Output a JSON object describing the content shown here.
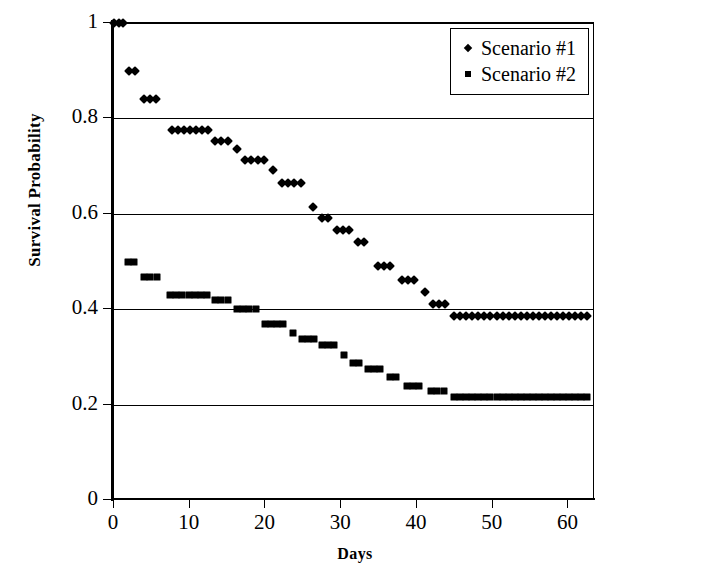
{
  "chart_data": {
    "type": "scatter",
    "title": "",
    "xlabel": "Days",
    "ylabel": "Survival Probability",
    "xlim": [
      0,
      63.5
    ],
    "ylim": [
      0,
      1
    ],
    "xticks": [
      0,
      10,
      20,
      30,
      40,
      50,
      60
    ],
    "yticks": [
      0,
      0.2,
      0.4,
      0.6,
      0.8,
      1
    ],
    "xtick_labels": [
      "0",
      "10",
      "20",
      "30",
      "40",
      "50",
      "60"
    ],
    "ytick_labels": [
      "0",
      "0.2",
      "0.4",
      "0.6",
      "0.8",
      "1"
    ],
    "grid": "horizontal",
    "legend_position": "top-right",
    "marker_color": "#000000",
    "series": [
      {
        "name": "Scenario #1",
        "marker": "diamond",
        "points": [
          [
            0.0,
            1.0
          ],
          [
            0.6,
            1.0
          ],
          [
            1.2,
            1.0
          ],
          [
            2.0,
            0.9
          ],
          [
            2.8,
            0.9
          ],
          [
            4.0,
            0.84
          ],
          [
            4.8,
            0.84
          ],
          [
            5.6,
            0.84
          ],
          [
            7.6,
            0.775
          ],
          [
            8.4,
            0.775
          ],
          [
            9.2,
            0.775
          ],
          [
            10.0,
            0.775
          ],
          [
            10.8,
            0.775
          ],
          [
            11.6,
            0.775
          ],
          [
            12.4,
            0.775
          ],
          [
            13.3,
            0.752
          ],
          [
            14.1,
            0.752
          ],
          [
            15.0,
            0.752
          ],
          [
            16.2,
            0.735
          ],
          [
            17.3,
            0.712
          ],
          [
            18.1,
            0.712
          ],
          [
            19.0,
            0.712
          ],
          [
            19.8,
            0.712
          ],
          [
            21.0,
            0.692
          ],
          [
            22.2,
            0.665
          ],
          [
            23.0,
            0.665
          ],
          [
            23.8,
            0.665
          ],
          [
            24.7,
            0.665
          ],
          [
            26.3,
            0.615
          ],
          [
            27.4,
            0.592
          ],
          [
            28.2,
            0.592
          ],
          [
            29.4,
            0.565
          ],
          [
            30.2,
            0.565
          ],
          [
            31.0,
            0.565
          ],
          [
            32.2,
            0.54
          ],
          [
            33.0,
            0.54
          ],
          [
            34.9,
            0.49
          ],
          [
            35.7,
            0.49
          ],
          [
            36.5,
            0.49
          ],
          [
            38.0,
            0.462
          ],
          [
            38.8,
            0.462
          ],
          [
            39.6,
            0.462
          ],
          [
            41.0,
            0.436
          ],
          [
            42.1,
            0.41
          ],
          [
            42.9,
            0.41
          ],
          [
            43.7,
            0.41
          ],
          [
            44.9,
            0.385
          ],
          [
            45.7,
            0.385
          ],
          [
            46.5,
            0.385
          ],
          [
            47.3,
            0.385
          ],
          [
            48.1,
            0.385
          ],
          [
            48.9,
            0.385
          ],
          [
            49.7,
            0.385
          ],
          [
            50.5,
            0.385
          ],
          [
            51.3,
            0.385
          ],
          [
            52.1,
            0.385
          ],
          [
            52.9,
            0.385
          ],
          [
            53.7,
            0.385
          ],
          [
            54.5,
            0.385
          ],
          [
            55.3,
            0.385
          ],
          [
            56.1,
            0.385
          ],
          [
            56.9,
            0.385
          ],
          [
            57.7,
            0.385
          ],
          [
            58.5,
            0.385
          ],
          [
            59.3,
            0.385
          ],
          [
            60.1,
            0.385
          ],
          [
            60.9,
            0.385
          ],
          [
            61.7,
            0.385
          ],
          [
            62.5,
            0.385
          ]
        ]
      },
      {
        "name": "Scenario #2",
        "marker": "square",
        "points": [
          [
            1.8,
            0.5
          ],
          [
            2.7,
            0.5
          ],
          [
            4.0,
            0.467
          ],
          [
            4.8,
            0.467
          ],
          [
            5.7,
            0.467
          ],
          [
            7.4,
            0.43
          ],
          [
            8.2,
            0.43
          ],
          [
            9.0,
            0.43
          ],
          [
            9.9,
            0.43
          ],
          [
            10.7,
            0.43
          ],
          [
            11.5,
            0.43
          ],
          [
            12.3,
            0.43
          ],
          [
            13.3,
            0.42
          ],
          [
            14.1,
            0.42
          ],
          [
            15.0,
            0.42
          ],
          [
            16.2,
            0.4
          ],
          [
            17.0,
            0.4
          ],
          [
            17.8,
            0.4
          ],
          [
            18.7,
            0.4
          ],
          [
            19.9,
            0.368
          ],
          [
            20.7,
            0.368
          ],
          [
            21.5,
            0.368
          ],
          [
            22.3,
            0.368
          ],
          [
            23.6,
            0.35
          ],
          [
            24.8,
            0.338
          ],
          [
            25.6,
            0.338
          ],
          [
            26.4,
            0.338
          ],
          [
            27.4,
            0.325
          ],
          [
            28.2,
            0.325
          ],
          [
            29.0,
            0.325
          ],
          [
            30.3,
            0.305
          ],
          [
            31.5,
            0.288
          ],
          [
            32.3,
            0.288
          ],
          [
            33.5,
            0.275
          ],
          [
            34.3,
            0.275
          ],
          [
            35.1,
            0.275
          ],
          [
            36.4,
            0.258
          ],
          [
            37.2,
            0.258
          ],
          [
            38.7,
            0.24
          ],
          [
            39.5,
            0.24
          ],
          [
            40.3,
            0.24
          ],
          [
            41.9,
            0.228
          ],
          [
            42.7,
            0.228
          ],
          [
            43.5,
            0.228
          ],
          [
            44.9,
            0.215
          ],
          [
            45.7,
            0.215
          ],
          [
            46.5,
            0.215
          ],
          [
            47.3,
            0.215
          ],
          [
            48.1,
            0.215
          ],
          [
            48.9,
            0.215
          ],
          [
            49.7,
            0.215
          ],
          [
            50.5,
            0.215
          ],
          [
            51.3,
            0.215
          ],
          [
            52.1,
            0.215
          ],
          [
            52.9,
            0.215
          ],
          [
            53.7,
            0.215
          ],
          [
            54.5,
            0.215
          ],
          [
            55.3,
            0.215
          ],
          [
            56.1,
            0.215
          ],
          [
            56.9,
            0.215
          ],
          [
            57.7,
            0.215
          ],
          [
            58.5,
            0.215
          ],
          [
            59.3,
            0.215
          ],
          [
            60.1,
            0.215
          ],
          [
            60.9,
            0.215
          ],
          [
            61.7,
            0.215
          ],
          [
            62.5,
            0.215
          ]
        ]
      }
    ]
  },
  "legend": {
    "items": [
      {
        "label": "Scenario #1",
        "marker": "diamond"
      },
      {
        "label": "Scenario #2",
        "marker": "square"
      }
    ]
  },
  "axes": {
    "x_title": "Days",
    "y_title": "Survival Probability"
  }
}
